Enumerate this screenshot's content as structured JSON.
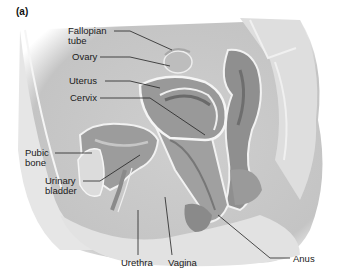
{
  "panel_label": "(a)",
  "labels": {
    "fallopian_tube": [
      "Fallopian",
      "tube"
    ],
    "ovary": "Ovary",
    "uterus": "Uterus",
    "cervix": "Cervix",
    "pubic_bone": [
      "Pubic",
      "bone"
    ],
    "urinary_bladder": [
      "Urinary",
      "bladder"
    ],
    "urethra": "Urethra",
    "vagina": "Vagina",
    "anus": "Anus"
  },
  "colors": {
    "background": "#ffffff",
    "body_fill": "#d9d9d9",
    "organ_dark": "#8c8c8c",
    "organ_mid": "#a6a6a6",
    "outline": "#f2f2f2",
    "leader": "#222222"
  }
}
